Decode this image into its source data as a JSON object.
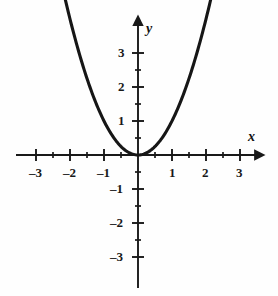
{
  "figure": {
    "background_color": "#fefefe",
    "ink_color": "#191919"
  },
  "chart_data": {
    "type": "line",
    "title": "",
    "subtitle": "",
    "xlabel": "x",
    "ylabel": "y",
    "equation": "y = x^2",
    "curve_name": "parabola",
    "grid": false,
    "legend": false,
    "xlim": [
      -3.4,
      3.4
    ],
    "ylim": [
      -3.4,
      3.6
    ],
    "x_major_ticks": [
      -3,
      -2,
      -1,
      1,
      2,
      3
    ],
    "y_major_ticks": [
      -3,
      -2,
      -1,
      1,
      2,
      3
    ],
    "x_minor_ticks": [
      -2.5,
      -1.5,
      -0.5,
      0.5,
      1.5,
      2.5
    ],
    "y_minor_ticks": [
      -2.5,
      -1.5,
      -0.5,
      0.5,
      1.5,
      2.5
    ],
    "x_tick_labels": [
      "–3",
      "–2",
      "–1",
      "1",
      "2",
      "3"
    ],
    "y_tick_labels": [
      "3",
      "2",
      "1",
      "–1",
      "–2",
      "–3"
    ],
    "x_domain_drawn": [
      -2.65,
      2.7
    ],
    "x": [
      -2.65,
      -2.5,
      -2.25,
      -2.0,
      -1.75,
      -1.5,
      -1.25,
      -1.0,
      -0.75,
      -0.5,
      -0.25,
      0,
      0.25,
      0.5,
      0.75,
      1.0,
      1.25,
      1.5,
      1.75,
      2.0,
      2.25,
      2.5,
      2.7
    ],
    "y": [
      7.02,
      6.25,
      5.06,
      4.0,
      3.06,
      2.25,
      1.56,
      1.0,
      0.56,
      0.25,
      0.06,
      0,
      0.06,
      0.25,
      0.56,
      1.0,
      1.56,
      2.25,
      3.06,
      4.0,
      5.06,
      6.25,
      7.29
    ],
    "vertex": [
      0,
      0
    ],
    "axis_arrows": [
      "x-positive",
      "y-positive"
    ]
  },
  "axis_labels": {
    "x": "x",
    "y": "y"
  },
  "x_labels": [
    {
      "text": "–3",
      "value": -3
    },
    {
      "text": "–2",
      "value": -2
    },
    {
      "text": "–1",
      "value": -1
    },
    {
      "text": "1",
      "value": 1
    },
    {
      "text": "2",
      "value": 2
    },
    {
      "text": "3",
      "value": 3
    }
  ],
  "y_labels": [
    {
      "text": "3",
      "value": 3
    },
    {
      "text": "2",
      "value": 2
    },
    {
      "text": "1",
      "value": 1
    },
    {
      "text": "–1",
      "value": -1
    },
    {
      "text": "–2",
      "value": -2
    },
    {
      "text": "–3",
      "value": -3
    }
  ]
}
